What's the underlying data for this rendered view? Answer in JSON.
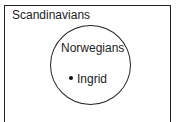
{
  "diagram": {
    "type": "euler",
    "outer_set": {
      "label": "Scandinavians"
    },
    "inner_set": {
      "label": "Norwegians"
    },
    "element": {
      "label": "Ingrid",
      "member_of": "Norwegians"
    }
  }
}
